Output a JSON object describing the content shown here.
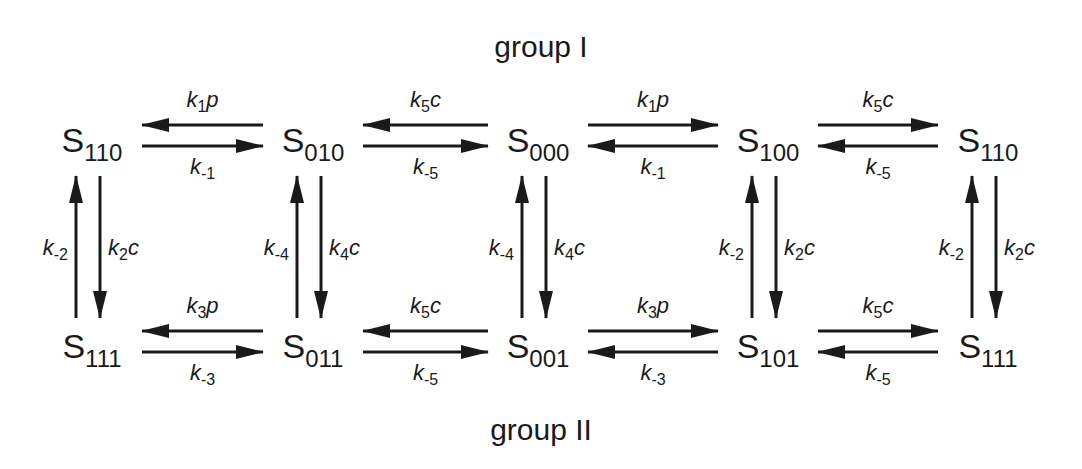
{
  "diagram": {
    "groups": {
      "top": "group I",
      "bottom": "group II"
    },
    "states": {
      "top": [
        {
          "name": "S",
          "sub": "110"
        },
        {
          "name": "S",
          "sub": "010"
        },
        {
          "name": "S",
          "sub": "000"
        },
        {
          "name": "S",
          "sub": "100"
        },
        {
          "name": "S",
          "sub": "110"
        }
      ],
      "bottom": [
        {
          "name": "S",
          "sub": "111"
        },
        {
          "name": "S",
          "sub": "011"
        },
        {
          "name": "S",
          "sub": "001"
        },
        {
          "name": "S",
          "sub": "101"
        },
        {
          "name": "S",
          "sub": "111"
        }
      ]
    },
    "horizontal_transitions": {
      "top": [
        {
          "upper": {
            "k": "k",
            "sub": "1",
            "var": "p"
          },
          "upper_dir": "left",
          "lower": {
            "k": "k",
            "sub": "-1",
            "var": ""
          },
          "lower_dir": "right"
        },
        {
          "upper": {
            "k": "k",
            "sub": "5",
            "var": "c"
          },
          "upper_dir": "left",
          "lower": {
            "k": "k",
            "sub": "-5",
            "var": ""
          },
          "lower_dir": "right"
        },
        {
          "upper": {
            "k": "k",
            "sub": "1",
            "var": "p"
          },
          "upper_dir": "right",
          "lower": {
            "k": "k",
            "sub": "-1",
            "var": ""
          },
          "lower_dir": "left"
        },
        {
          "upper": {
            "k": "k",
            "sub": "5",
            "var": "c"
          },
          "upper_dir": "right",
          "lower": {
            "k": "k",
            "sub": "-5",
            "var": ""
          },
          "lower_dir": "left"
        }
      ],
      "bottom": [
        {
          "upper": {
            "k": "k",
            "sub": "3",
            "var": "p"
          },
          "upper_dir": "left",
          "lower": {
            "k": "k",
            "sub": "-3",
            "var": ""
          },
          "lower_dir": "right"
        },
        {
          "upper": {
            "k": "k",
            "sub": "5",
            "var": "c"
          },
          "upper_dir": "left",
          "lower": {
            "k": "k",
            "sub": "-5",
            "var": ""
          },
          "lower_dir": "right"
        },
        {
          "upper": {
            "k": "k",
            "sub": "3",
            "var": "p"
          },
          "upper_dir": "right",
          "lower": {
            "k": "k",
            "sub": "-3",
            "var": ""
          },
          "lower_dir": "left"
        },
        {
          "upper": {
            "k": "k",
            "sub": "5",
            "var": "c"
          },
          "upper_dir": "right",
          "lower": {
            "k": "k",
            "sub": "-5",
            "var": ""
          },
          "lower_dir": "left"
        }
      ]
    },
    "vertical_transitions": [
      {
        "left": {
          "k": "k",
          "sub": "-2",
          "var": ""
        },
        "left_dir": "up",
        "right": {
          "k": "k",
          "sub": "2",
          "var": "c"
        },
        "right_dir": "down"
      },
      {
        "left": {
          "k": "k",
          "sub": "-4",
          "var": ""
        },
        "left_dir": "up",
        "right": {
          "k": "k",
          "sub": "4",
          "var": "c"
        },
        "right_dir": "down"
      },
      {
        "left": {
          "k": "k",
          "sub": "-4",
          "var": ""
        },
        "left_dir": "up",
        "right": {
          "k": "k",
          "sub": "4",
          "var": "c"
        },
        "right_dir": "down"
      },
      {
        "left": {
          "k": "k",
          "sub": "-2",
          "var": ""
        },
        "left_dir": "up",
        "right": {
          "k": "k",
          "sub": "2",
          "var": "c"
        },
        "right_dir": "down"
      },
      {
        "left": {
          "k": "k",
          "sub": "-2",
          "var": ""
        },
        "left_dir": "up",
        "right": {
          "k": "k",
          "sub": "2",
          "var": "c"
        },
        "right_dir": "down"
      }
    ],
    "colors": {
      "ink": "#1a1a1a",
      "background": "#ffffff"
    }
  }
}
